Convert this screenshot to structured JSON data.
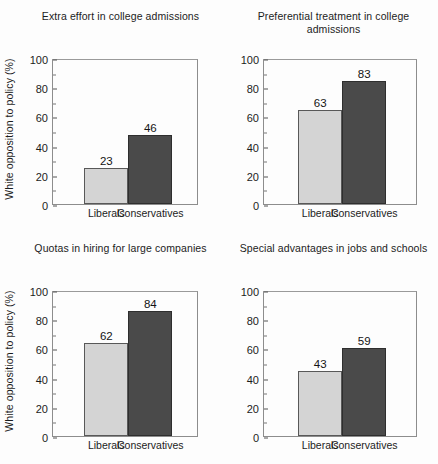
{
  "chart_data": [
    {
      "type": "bar",
      "panel": "top-left",
      "title": "Extra effort in college admissions",
      "categories": [
        "Liberals",
        "Conservatives"
      ],
      "values": [
        23,
        46
      ],
      "xlabel": "",
      "ylabel": "White opposition to policy (%)",
      "show_ylabel": true,
      "ylim": [
        0,
        100
      ],
      "yticks": [
        0,
        20,
        40,
        60,
        80,
        100
      ],
      "yminorticks": [
        10,
        30,
        50,
        70,
        90
      ],
      "grid": false,
      "legend": "none"
    },
    {
      "type": "bar",
      "panel": "top-right",
      "title": "Preferential treatment in college admissions",
      "categories": [
        "Liberals",
        "Conservatives"
      ],
      "values": [
        63,
        83
      ],
      "xlabel": "",
      "ylabel": "",
      "show_ylabel": false,
      "ylim": [
        0,
        100
      ],
      "yticks": [
        0,
        20,
        40,
        60,
        80,
        100
      ],
      "yminorticks": [
        10,
        30,
        50,
        70,
        90
      ],
      "grid": false,
      "legend": "none"
    },
    {
      "type": "bar",
      "panel": "bottom-left",
      "title": "Quotas in hiring for large companies",
      "categories": [
        "Liberals",
        "Conservatives"
      ],
      "values": [
        62,
        84
      ],
      "xlabel": "",
      "ylabel": "White opposition to policy (%)",
      "show_ylabel": true,
      "ylim": [
        0,
        100
      ],
      "yticks": [
        0,
        20,
        40,
        60,
        80,
        100
      ],
      "yminorticks": [
        10,
        30,
        50,
        70,
        90
      ],
      "grid": false,
      "legend": "none"
    },
    {
      "type": "bar",
      "panel": "bottom-right",
      "title": "Special advantages in jobs and schools",
      "categories": [
        "Liberals",
        "Conservatives"
      ],
      "values": [
        43,
        59
      ],
      "xlabel": "",
      "ylabel": "",
      "show_ylabel": false,
      "ylim": [
        0,
        100
      ],
      "yticks": [
        0,
        20,
        40,
        60,
        80,
        100
      ],
      "yminorticks": [
        10,
        30,
        50,
        70,
        90
      ],
      "grid": false,
      "legend": "none"
    }
  ],
  "style": {
    "bar_colors": [
      "#d4d4d4",
      "#4a4a4a"
    ],
    "frame_color": "#8d8d8d",
    "background": "#fdfdfd",
    "text_color": "#1c1c1c"
  }
}
